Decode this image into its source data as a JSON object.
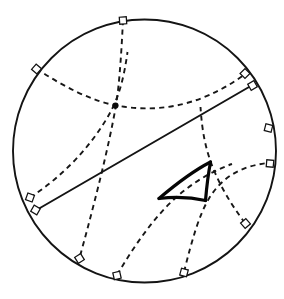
{
  "figure": {
    "canvas": {
      "width": 284,
      "height": 299,
      "background": "#ffffff"
    },
    "disk": {
      "name": "boundary-circle",
      "center_x": 144.5,
      "center_y": 151.0,
      "radius": 131.5,
      "stroke_color": "#141414",
      "stroke_width": 1.9
    },
    "colors": {
      "ink": "#141414",
      "dashed_ink": "#171717",
      "bold_ink": "#050505",
      "marker_fill": "#ffffff",
      "background": "#ffffff"
    },
    "styles": {
      "dash_pattern": "5.2 4.2",
      "dashed_stroke_width": 1.9,
      "solid_stroke_width": 2.0,
      "bold_stroke_width": 3.2,
      "marker_size": 7.0
    },
    "counts": {
      "dashed_geodesics": 6,
      "solid_geodesics": 1,
      "right_angle_markers": 12,
      "intersection_dots": 1,
      "triangle_vertices": 3
    },
    "dashed_geodesics": [
      {
        "name": "geodesic-upper-left-to-bottom-center",
        "path": "M 123.0 20.0 C 121.0 62.0 118.5 92.0 115.5 108.0 C 109.0 145.0 95.5 200.0 79.5 258.0"
      },
      {
        "name": "geodesic-northwest-to-east",
        "path": "M 36.5 68.5 C 62.0 86.0 92.0 101.0 116.0 105.5 C 152.0 112.0 196.0 110.0 246.0 73.5"
      },
      {
        "name": "geodesic-west-to-center-down",
        "path": "M 30.0 197.5 C 62.0 177.0 92.0 146.0 110.5 112.0 C 119.0 96.0 124.0 78.0 127.5 52.0"
      },
      {
        "name": "geodesic-bottom-left-to-triangle-apex",
        "path": "M 117.0 275.0 C 137.0 241.0 160.0 209.0 185.5 189.5 C 200.0 178.5 215.0 170.0 232.0 164.0"
      },
      {
        "name": "geodesic-bottom-center-to-east",
        "path": "M 184.0 272.0 C 192.0 240.0 199.0 215.0 209.0 198.5 C 222.0 177.0 241.0 166.0 268.0 163.0"
      },
      {
        "name": "geodesic-southeast-to-triangle-top",
        "path": "M 245.0 223.0 C 230.0 203.0 219.0 184.0 211.5 164.0 C 205.5 148.0 202.0 131.0 200.5 107.0"
      }
    ],
    "solid_geodesics": [
      {
        "name": "geodesic-solid-diameter",
        "x1": 36.5,
        "y1": 210.0,
        "x2": 252.5,
        "y2": 85.0
      }
    ],
    "triangle": {
      "name": "geodesic-triangle",
      "vertices": [
        {
          "name": "triangle-vertex-apex",
          "x": 210.5,
          "y": 162.0
        },
        {
          "name": "triangle-vertex-left",
          "x": 159.0,
          "y": 198.5
        },
        {
          "name": "triangle-vertex-right",
          "x": 205.5,
          "y": 200.5
        }
      ],
      "edges": [
        {
          "name": "triangle-edge-apex-to-left",
          "path": "M 210.5 162.0 C 195.0 170.0 176.0 184.0 159.0 198.5"
        },
        {
          "name": "triangle-edge-left-to-right",
          "path": "M 159.0 198.5 C 176.0 196.5 192.0 197.5 205.5 200.5"
        },
        {
          "name": "triangle-edge-right-to-apex",
          "path": "M 205.5 200.5 C 206.5 189.0 208.0 175.0 210.5 162.0"
        }
      ]
    },
    "right_angle_markers": [
      {
        "name": "right-angle-marker-top",
        "x": 123.0,
        "y": 20.5,
        "rotation": 356
      },
      {
        "name": "right-angle-marker-northwest",
        "x": 36.5,
        "y": 69.0,
        "rotation": 41
      },
      {
        "name": "right-angle-marker-northeast-dashed",
        "x": 245.0,
        "y": 73.5,
        "rotation": 315
      },
      {
        "name": "right-angle-marker-northeast-solid",
        "x": 252.5,
        "y": 85.5,
        "rotation": 330
      },
      {
        "name": "right-angle-marker-east-upper",
        "x": 268.5,
        "y": 128.0,
        "rotation": 284
      },
      {
        "name": "right-angle-marker-east-lower",
        "x": 270.0,
        "y": 163.5,
        "rotation": 275
      },
      {
        "name": "right-angle-marker-west-dashed",
        "x": 30.0,
        "y": 197.5,
        "rotation": 110
      },
      {
        "name": "right-angle-marker-west-solid",
        "x": 35.5,
        "y": 210.0,
        "rotation": 120
      },
      {
        "name": "right-angle-marker-southeast",
        "x": 245.5,
        "y": 223.5,
        "rotation": 229
      },
      {
        "name": "right-angle-marker-south-east-low",
        "x": 184.0,
        "y": 272.5,
        "rotation": 195
      },
      {
        "name": "right-angle-marker-south-center",
        "x": 117.0,
        "y": 275.5,
        "rotation": 167
      },
      {
        "name": "right-angle-marker-southwest",
        "x": 79.5,
        "y": 258.5,
        "rotation": 148
      }
    ],
    "intersection_dots": [
      {
        "name": "intersection-point-dot",
        "x": 115.5,
        "y": 105.5,
        "radius": 3.1
      }
    ]
  }
}
